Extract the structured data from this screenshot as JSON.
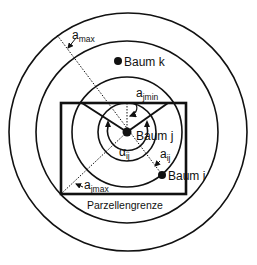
{
  "diagram": {
    "colors": {
      "stroke": "#111111",
      "background": "#ffffff"
    },
    "center_tree": {
      "label": "Baum j"
    },
    "trees": [
      {
        "id": "baum-k",
        "label": "Baum k"
      },
      {
        "id": "baum-i",
        "label": "Baum i"
      }
    ],
    "annotations": {
      "a_max": {
        "base": "a",
        "sub": "max"
      },
      "a_jmin": {
        "base": "a",
        "sub": "jmin"
      },
      "a_jmax": {
        "base": "a",
        "sub": "jmax"
      },
      "a_ij": {
        "base": "a",
        "sub": "ij"
      },
      "alpha_ij": {
        "base": "α",
        "sub": "ij"
      }
    },
    "plot_boundary_label": "Parzellengrenze"
  }
}
